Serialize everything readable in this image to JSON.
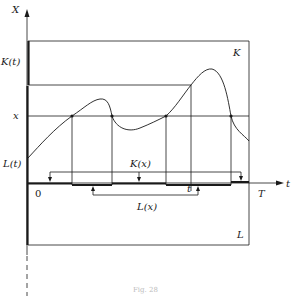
{
  "figure": {
    "axis_y_label": "X",
    "axis_x_label": "t",
    "label_K_t": "K(t)",
    "label_x": "x",
    "label_L_t": "L(t)",
    "label_origin": "0",
    "label_T": "T",
    "label_K_region": "K",
    "label_L_region": "L",
    "label_K_x": "K(x)",
    "label_L_x": "L(x)",
    "label_t_point": "t",
    "caption": "Fig. 28"
  }
}
